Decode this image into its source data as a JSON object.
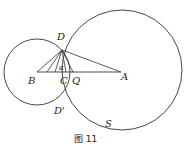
{
  "figure": {
    "caption": "图 11",
    "stroke_color": "#333333",
    "points": {
      "D": "D",
      "B": "B",
      "C": "C",
      "Q": "Q",
      "A": "A",
      "D_prime": "D'",
      "S": "S"
    },
    "angle_label": "α",
    "circles": [
      {
        "name": "circle-B",
        "center": "B"
      },
      {
        "name": "circle-A",
        "center": "A",
        "label": "S"
      }
    ],
    "segments": [
      "DB",
      "DC",
      "DQ",
      "DA",
      "BA"
    ]
  }
}
